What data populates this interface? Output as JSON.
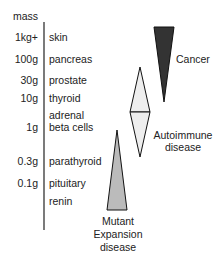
{
  "axis": {
    "header": "mass"
  },
  "rows": [
    {
      "mass": "1kg+",
      "organ": "skin"
    },
    {
      "mass": "100g",
      "organ": "pancreas"
    },
    {
      "mass": "30g",
      "organ": "prostate"
    },
    {
      "mass": "10g",
      "organ": "thyroid"
    },
    {
      "mass": "",
      "organ": "adrenal"
    },
    {
      "mass": "1g",
      "organ": "beta cells"
    },
    {
      "mass": "0.3g",
      "organ": "parathyroid"
    },
    {
      "mass": "0.1g",
      "organ": "pituitary"
    },
    {
      "mass": "",
      "organ": "renin"
    }
  ],
  "diseases": {
    "cancer": {
      "label": "Cancer",
      "color": "#333333"
    },
    "autoimmune": {
      "label_line1": "Autoimmune",
      "label_line2": "disease",
      "color": "#eeeeee"
    },
    "mutant": {
      "label_line1": "Mutant",
      "label_line2": "Expansion",
      "label_line3": "disease",
      "color": "#bbbbbb"
    }
  }
}
